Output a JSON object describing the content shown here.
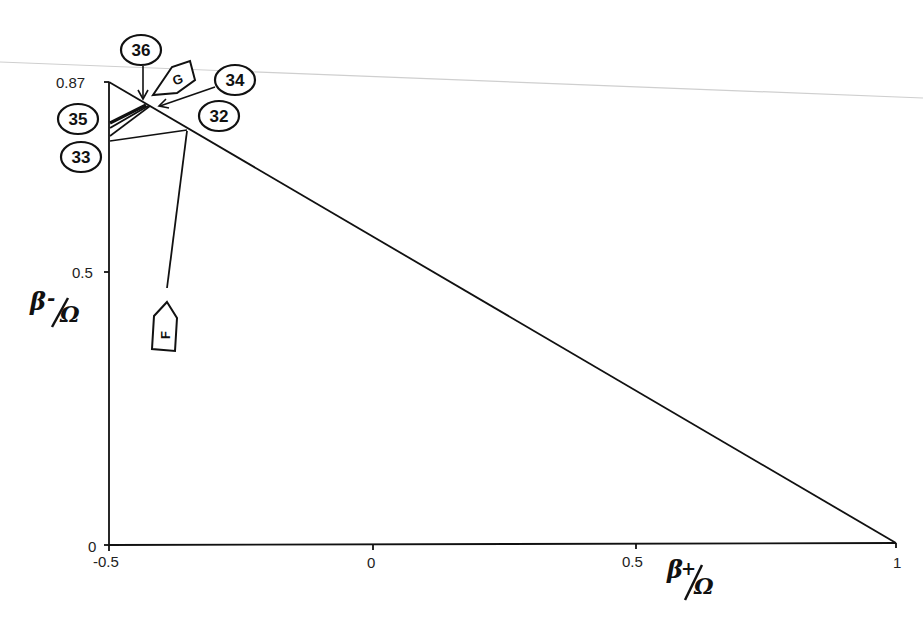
{
  "figure": {
    "type": "hand-drawn parameter-space diagram",
    "x_axis": {
      "label_main": "β",
      "label_sub": "+",
      "label_den": "Ω",
      "ticks": [
        "-0.5",
        "0",
        "0.5",
        "1"
      ],
      "range": [
        -0.5,
        1
      ]
    },
    "y_axis": {
      "label_main": "β",
      "label_sub": "-",
      "label_den": "Ω",
      "ticks": [
        "0",
        "0.5",
        "0.87"
      ],
      "range": [
        0,
        0.87
      ]
    },
    "region": {
      "shape": "triangle",
      "vertices": [
        [
          -0.5,
          0
        ],
        [
          -0.5,
          0.87
        ],
        [
          1,
          0
        ]
      ]
    },
    "circled_labels": [
      {
        "id": "36",
        "text": "36"
      },
      {
        "id": "34",
        "text": "34"
      },
      {
        "id": "35",
        "text": "35"
      },
      {
        "id": "32",
        "text": "32"
      },
      {
        "id": "33",
        "text": "33"
      }
    ],
    "tag_labels": [
      {
        "id": "G",
        "text": "G"
      },
      {
        "id": "F",
        "text": "F"
      }
    ]
  }
}
